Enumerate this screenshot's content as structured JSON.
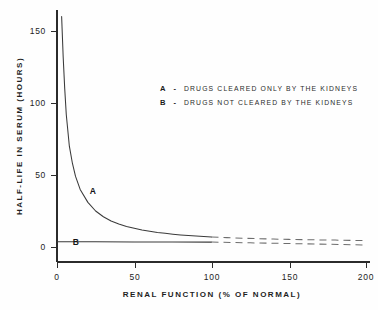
{
  "chart_data": {
    "type": "line",
    "title": "",
    "xlabel": "RENAL FUNCTION (% OF NORMAL)",
    "ylabel": "HALF-LIFE IN SERUM (HOURS)",
    "xlim": [
      0,
      200
    ],
    "ylim": [
      0,
      160
    ],
    "xticks": [
      0,
      50,
      100,
      150,
      200
    ],
    "xtick_labels": [
      "0",
      "50",
      "100",
      "150",
      "200"
    ],
    "yticks": [
      0,
      50,
      100,
      150
    ],
    "ytick_labels": [
      "0",
      "50",
      "100",
      "150"
    ],
    "grid": false,
    "legend_position": "upper-right",
    "series": [
      {
        "name": "A",
        "label": "A",
        "legend_key": "A",
        "legend_dash": "-",
        "legend_text": "DRUGS CLEARED ONLY BY THE KIDNEYS",
        "style": "solid-then-dashed",
        "break_x": 100,
        "x": [
          3,
          4,
          5,
          6,
          8,
          10,
          12,
          15,
          20,
          25,
          30,
          35,
          40,
          45,
          50,
          55,
          60,
          65,
          70,
          75,
          80,
          85,
          90,
          95,
          100,
          110,
          120,
          130,
          140,
          150,
          160,
          170,
          180,
          190,
          200
        ],
        "y": [
          160,
          132,
          110,
          92,
          70,
          58,
          49,
          40,
          31,
          25,
          21,
          18,
          16,
          14.3,
          13,
          11.8,
          10.9,
          10.1,
          9.5,
          8.9,
          8.4,
          8.0,
          7.6,
          7.3,
          7.0,
          6.5,
          6.1,
          5.8,
          5.5,
          5.3,
          5.1,
          4.9,
          4.8,
          4.6,
          4.5
        ]
      },
      {
        "name": "B",
        "label": "B",
        "legend_key": "B",
        "legend_dash": "-",
        "legend_text": "DRUGS NOT CLEARED BY THE KIDNEYS",
        "style": "solid-then-dashed",
        "break_x": 100,
        "x": [
          0,
          25,
          50,
          75,
          100,
          125,
          150,
          175,
          200
        ],
        "y": [
          3.6,
          3.6,
          3.5,
          3.5,
          3.4,
          2.9,
          2.4,
          1.9,
          1.4
        ]
      }
    ],
    "annotations": [
      {
        "text": "A",
        "x": 23,
        "y": 39
      },
      {
        "text": "B",
        "x": 12,
        "y": 7
      }
    ]
  },
  "legend": {
    "entries": [
      {
        "key": "A",
        "dash": "-",
        "text": "DRUGS CLEARED ONLY BY THE KIDNEYS"
      },
      {
        "key": "B",
        "dash": "-",
        "text": "DRUGS NOT CLEARED BY THE KIDNEYS"
      }
    ]
  },
  "axes": {
    "x_title": "RENAL FUNCTION (% OF NORMAL)",
    "y_title": "HALF-LIFE IN SERUM (HOURS)",
    "x_tick_labels": [
      "0",
      "50",
      "100",
      "150",
      "200"
    ],
    "y_tick_labels": [
      "0",
      "50",
      "100",
      "150"
    ]
  },
  "colors": {
    "background": "#fefefe",
    "axis": "#2b2b2b",
    "curve_solid": "#3a3a3a",
    "curve_dashed": "#6d6d6d",
    "text": "#1f1f1f"
  }
}
